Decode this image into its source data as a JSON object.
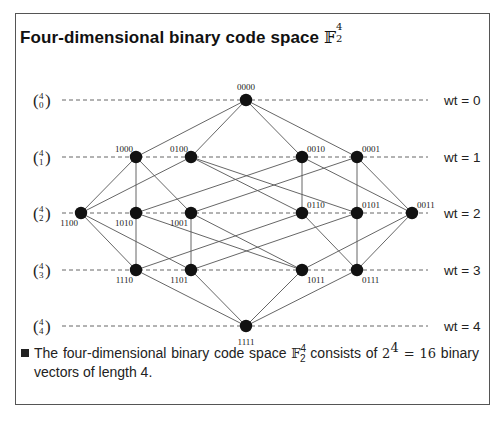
{
  "title": {
    "text": "Four-dimensional binary code space",
    "math_symbol": "𝔽",
    "superscript": "4",
    "subscript": "2"
  },
  "levels": [
    {
      "binom_top": "4",
      "binom_bottom": "0",
      "wt_label": "wt = 0",
      "y": 100
    },
    {
      "binom_top": "4",
      "binom_bottom": "1",
      "wt_label": "wt = 1",
      "y": 157
    },
    {
      "binom_top": "4",
      "binom_bottom": "2",
      "wt_label": "wt = 2",
      "y": 213
    },
    {
      "binom_top": "4",
      "binom_bottom": "3",
      "wt_label": "wt = 3",
      "y": 270
    },
    {
      "binom_top": "4",
      "binom_bottom": "4",
      "wt_label": "wt = 4",
      "y": 326
    }
  ],
  "nodes": [
    {
      "id": "0000",
      "x": 246,
      "y": 100,
      "label_pos": "top"
    },
    {
      "id": "1000",
      "x": 136,
      "y": 157,
      "label_pos": "top-left"
    },
    {
      "id": "0100",
      "x": 191,
      "y": 157,
      "label_pos": "top-left"
    },
    {
      "id": "0010",
      "x": 302,
      "y": 157,
      "label_pos": "top-right"
    },
    {
      "id": "0001",
      "x": 357,
      "y": 157,
      "label_pos": "top-right"
    },
    {
      "id": "1100",
      "x": 81,
      "y": 213,
      "label_pos": "bottom-left"
    },
    {
      "id": "1010",
      "x": 136,
      "y": 213,
      "label_pos": "bottom-left"
    },
    {
      "id": "1001",
      "x": 191,
      "y": 213,
      "label_pos": "bottom-left"
    },
    {
      "id": "0110",
      "x": 302,
      "y": 213,
      "label_pos": "top-right"
    },
    {
      "id": "0101",
      "x": 357,
      "y": 213,
      "label_pos": "top-right"
    },
    {
      "id": "0011",
      "x": 412,
      "y": 213,
      "label_pos": "top-right"
    },
    {
      "id": "1110",
      "x": 136,
      "y": 270,
      "label_pos": "bottom-left"
    },
    {
      "id": "1101",
      "x": 191,
      "y": 270,
      "label_pos": "bottom-left"
    },
    {
      "id": "1011",
      "x": 302,
      "y": 270,
      "label_pos": "bottom-right"
    },
    {
      "id": "0111",
      "x": 357,
      "y": 270,
      "label_pos": "bottom-right"
    },
    {
      "id": "1111",
      "x": 246,
      "y": 326,
      "label_pos": "bottom"
    }
  ],
  "caption": {
    "text_before": "The four-dimensional binary code space ",
    "math_symbol": "𝔽",
    "superscript": "4",
    "subscript": "2",
    "text_middle": " consists of ",
    "power_base": "2",
    "power_exp": "4",
    "equals": " = 16",
    "text_after": " binary vectors of length 4."
  },
  "style": {
    "node_color": "#111111",
    "edge_color": "#555555",
    "dash_color": "#666666"
  }
}
